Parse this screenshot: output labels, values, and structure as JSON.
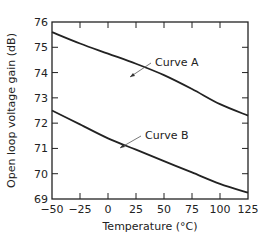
{
  "chart_data": {
    "type": "line",
    "title": "",
    "xlabel": "Temperature (°C)",
    "ylabel": "Open loop voltage gain (dB)",
    "xlim": [
      -50,
      125
    ],
    "ylim": [
      69,
      76
    ],
    "xticks": [
      -50,
      -25,
      0,
      25,
      50,
      75,
      100,
      125
    ],
    "yticks": [
      69,
      70,
      71,
      72,
      73,
      74,
      75,
      76
    ],
    "grid": false,
    "legend": "inline annotations",
    "x": [
      -50,
      -25,
      0,
      25,
      50,
      75,
      100,
      125
    ],
    "series": [
      {
        "name": "Curve A",
        "values": [
          75.6,
          75.15,
          74.75,
          74.35,
          73.9,
          73.35,
          72.75,
          72.3
        ]
      },
      {
        "name": "Curve B",
        "values": [
          72.5,
          71.95,
          71.4,
          70.95,
          70.5,
          70.05,
          69.6,
          69.25
        ]
      }
    ],
    "annotations": [
      {
        "text": "Curve A",
        "points_to_x": 8,
        "points_to_y": 74.5
      },
      {
        "text": "Curve B",
        "points_to_x": 10,
        "points_to_y": 71.2
      }
    ]
  }
}
